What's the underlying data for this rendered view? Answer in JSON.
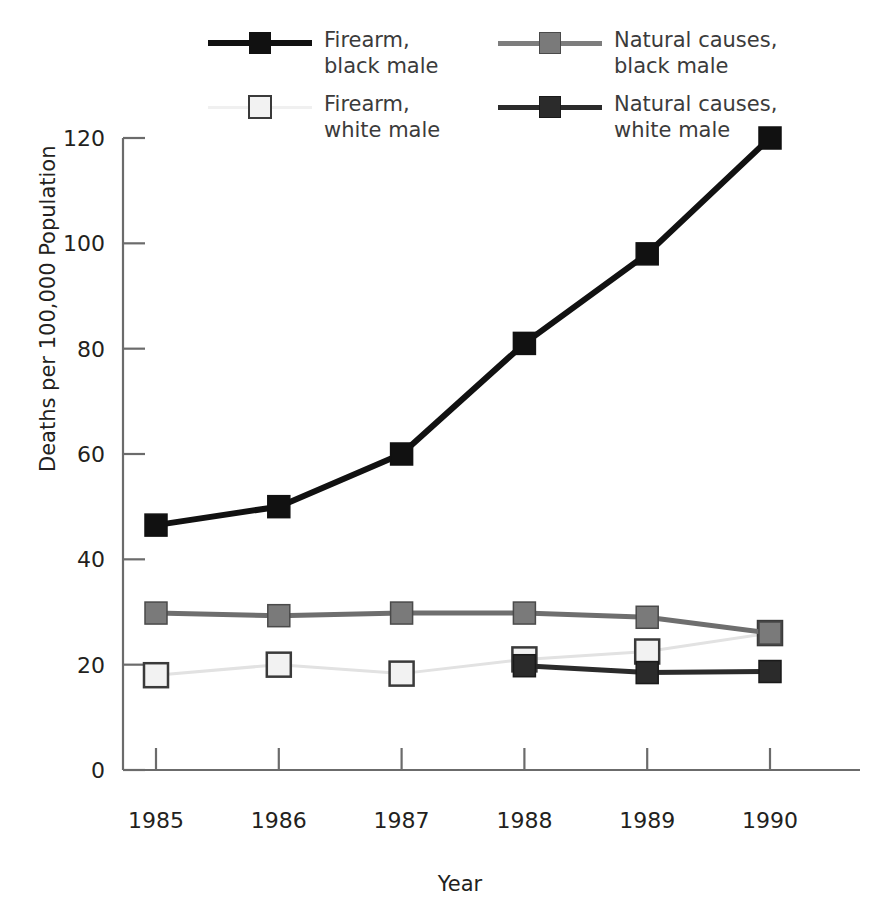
{
  "chart_data": {
    "type": "line",
    "title": "",
    "xlabel": "Year",
    "ylabel": "Deaths per 100,000 Population",
    "categories": [
      "1985",
      "1986",
      "1987",
      "1988",
      "1989",
      "1990"
    ],
    "x": [
      1985,
      1986,
      1987,
      1988,
      1989,
      1990
    ],
    "xlim": [
      1985,
      1990
    ],
    "ylim": [
      0,
      120
    ],
    "yticks": [
      0,
      20,
      40,
      60,
      80,
      100,
      120
    ],
    "ytick_labels": [
      "0",
      "20",
      "40",
      "60",
      "80",
      "100",
      "120"
    ],
    "xtick_labels": [
      "1985",
      "1986",
      "1987",
      "1988",
      "1989",
      "1990"
    ],
    "grid": false,
    "legend_position": "top",
    "series": [
      {
        "name": "Firearm, black male",
        "label_line1": "Firearm,",
        "label_line2": "black male",
        "color": "#111111",
        "marker": "filled-square",
        "marker_fill": "#111111",
        "marker_edge": "#111111",
        "line_width": 6,
        "values": [
          46.5,
          50,
          60,
          81,
          98,
          120
        ]
      },
      {
        "name": "Natural causes, black male",
        "label_line1": "Natural causes,",
        "label_line2": "black male",
        "color": "#6e6e6e",
        "marker": "filled-square",
        "marker_fill": "#7a7a7a",
        "marker_edge": "#4a4a4a",
        "line_width": 5,
        "values": [
          29.8,
          29.3,
          29.8,
          29.8,
          29.0,
          26.0
        ]
      },
      {
        "name": "Firearm, white male",
        "label_line1": "Firearm,",
        "label_line2": "white male",
        "color": "#e2e2e2",
        "marker": "open-square",
        "marker_fill": "#f2f2f2",
        "marker_edge": "#3a3a3a",
        "line_width": 3,
        "values": [
          18.0,
          20.0,
          18.3,
          21.0,
          22.5,
          26.0
        ]
      },
      {
        "name": "Natural causes, white male",
        "label_line1": "Natural causes,",
        "label_line2": "white male",
        "color": "#2b2b2b",
        "marker": "filled-square",
        "marker_fill": "#2b2b2b",
        "marker_edge": "#1a1a1a",
        "line_width": 5,
        "values": [
          null,
          null,
          null,
          19.8,
          18.5,
          18.7
        ]
      }
    ]
  },
  "axis": {
    "spine_color": "#6b6b6b",
    "tick_color": "#6b6b6b"
  }
}
